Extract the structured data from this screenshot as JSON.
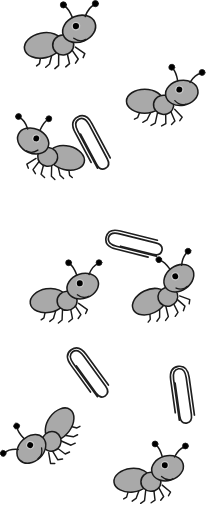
{
  "scene": {
    "title": "Visual search array: cartoon ants and paperclips",
    "width": 218,
    "height": 519,
    "background_color": "#ffffff",
    "ant_count": 7,
    "paperclip_count": 4,
    "total_items": 11
  },
  "palette": {
    "body_fill": "#a9a9a9",
    "outline": "#1a1a1a",
    "eye": "#000000",
    "eye_ring": "#c9c9c9",
    "paperclip_stroke": "#1f1f1f",
    "paperclip_fill": "#ffffff",
    "background": "#ffffff"
  },
  "items": [
    {
      "id": "ant-1",
      "kind": "ant",
      "label": "ant",
      "facing": "right",
      "x": 22,
      "y": 10,
      "scale": 1.0,
      "rotation": -4,
      "flip": false
    },
    {
      "id": "ant-2",
      "kind": "ant",
      "label": "ant",
      "facing": "right",
      "x": 123,
      "y": 70,
      "scale": 0.96,
      "rotation": 8,
      "flip": false
    },
    {
      "id": "ant-3",
      "kind": "ant",
      "label": "ant",
      "facing": "left",
      "x": 7,
      "y": 122,
      "scale": 0.95,
      "rotation": 6,
      "flip": true
    },
    {
      "id": "ant-4",
      "kind": "ant",
      "label": "ant",
      "facing": "right",
      "x": 26,
      "y": 266,
      "scale": 0.95,
      "rotation": -2,
      "flip": false
    },
    {
      "id": "ant-5",
      "kind": "ant",
      "label": "ant",
      "facing": "right",
      "x": 126,
      "y": 262,
      "scale": 0.95,
      "rotation": -18,
      "flip": false
    },
    {
      "id": "ant-6",
      "kind": "ant",
      "label": "ant",
      "facing": "left",
      "x": 8,
      "y": 408,
      "scale": 0.95,
      "rotation": -62,
      "flip": true
    },
    {
      "id": "ant-7",
      "kind": "ant",
      "label": "ant",
      "facing": "right",
      "x": 110,
      "y": 447,
      "scale": 0.95,
      "rotation": 2,
      "flip": false
    },
    {
      "id": "clip-1",
      "kind": "paperclip",
      "label": "paperclip",
      "x": 78,
      "y": 112,
      "scale": 1.0,
      "rotation": -28,
      "flip": false
    },
    {
      "id": "clip-2",
      "kind": "paperclip",
      "label": "paperclip",
      "x": 122,
      "y": 212,
      "scale": 0.98,
      "rotation": -76,
      "flip": false
    },
    {
      "id": "clip-3",
      "kind": "paperclip",
      "label": "paperclip",
      "x": 75,
      "y": 342,
      "scale": 0.98,
      "rotation": -36,
      "flip": false
    },
    {
      "id": "clip-4",
      "kind": "paperclip",
      "label": "paperclip",
      "x": 168,
      "y": 364,
      "scale": 0.98,
      "rotation": -8,
      "flip": false
    }
  ]
}
